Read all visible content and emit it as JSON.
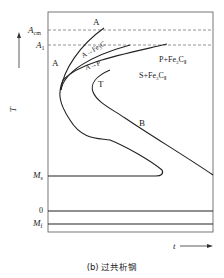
{
  "diagram": {
    "type": "TTT diagram",
    "y_axis_label": "T",
    "x_axis_label": "t",
    "left_labels": {
      "acm": "A",
      "acm_sub": "cm",
      "a1": "A",
      "a1_sub": "1",
      "ms": "M",
      "ms_sub": "s",
      "zero": "0",
      "mf": "M",
      "mf_sub": "f"
    },
    "regions": {
      "austenite_top": "A",
      "austenite_left": "A",
      "a_to_fe3c": "A→Fe",
      "a_to_fe3c_sub": "3",
      "a_to_fe3c_tail": "C",
      "a_to_p": "A→P",
      "p_plus_fe3c": "P+Fe",
      "p_plus_fe3c_sub": "3",
      "p_plus_fe3c_tail": "C",
      "p_plus_fe3c_sub2": "Ⅱ",
      "s_plus_fe3c": "S+Fe",
      "s_plus_fe3c_sub": "3",
      "s_plus_fe3c_tail": "C",
      "s_plus_fe3c_sub2": "Ⅱ",
      "troostite": "T",
      "bainite": "B"
    },
    "caption": "(b) 过共析钢",
    "line_color": "#222222",
    "frame_color": "#444444"
  }
}
